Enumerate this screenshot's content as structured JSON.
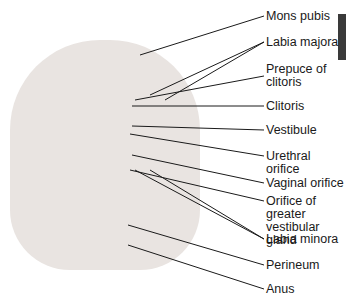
{
  "figure": {
    "labels": [
      {
        "text": "Mons pubis",
        "x": 266,
        "y": 10
      },
      {
        "text": "Labia majora",
        "x": 266,
        "y": 36
      },
      {
        "text": "Prepuce of\nclitoris",
        "x": 266,
        "y": 63
      },
      {
        "text": "Clitoris",
        "x": 266,
        "y": 100
      },
      {
        "text": "Vestibule",
        "x": 266,
        "y": 124
      },
      {
        "text": "Urethral orifice",
        "x": 266,
        "y": 150
      },
      {
        "text": "Vaginal orifice",
        "x": 266,
        "y": 177
      },
      {
        "text": "Orifice of greater\nvestibular gland",
        "x": 266,
        "y": 195
      },
      {
        "text": "Labia minora",
        "x": 266,
        "y": 233
      },
      {
        "text": "Perineum",
        "x": 266,
        "y": 259
      },
      {
        "text": "Anus",
        "x": 266,
        "y": 283
      }
    ],
    "leader_color": "#1a1a1a",
    "tab_color": "#3a3a3a"
  }
}
